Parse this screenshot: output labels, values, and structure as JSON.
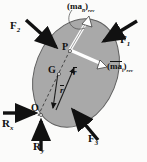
{
  "figure": {
    "background_color": "#fbfbfa",
    "body_fill": "#a9a9a9",
    "body_stroke": "#5a5a5a",
    "arrow_color": "#111111",
    "inertia_arrow_fill": "#ffffff"
  },
  "body": {
    "shape": "ellipse",
    "cx": 76,
    "cy": 73,
    "rx": 41,
    "ry": 56,
    "rotation_deg": 22
  },
  "points": [
    {
      "id": "P",
      "label": "P",
      "x": 70,
      "y": 50
    },
    {
      "id": "G",
      "label": "G",
      "x": 58,
      "y": 73
    },
    {
      "id": "O",
      "label": "O",
      "x": 40,
      "y": 113
    }
  ],
  "forces": [
    {
      "name": "F2",
      "label": "F",
      "subscript": "2",
      "label_x": 11,
      "label_y": 22,
      "tail": {
        "x": 27,
        "y": 21
      },
      "head": {
        "x": 58,
        "y": 49
      }
    },
    {
      "name": "F1",
      "label": "F",
      "subscript": "1",
      "label_x": 120,
      "label_y": 36,
      "tail": {
        "x": 136,
        "y": 22
      },
      "head": {
        "x": 101,
        "y": 42
      }
    },
    {
      "name": "F3",
      "label": "F",
      "subscript": "3",
      "label_x": 89,
      "label_y": 136,
      "tail": {
        "x": 97,
        "y": 139
      },
      "head": {
        "x": 71,
        "y": 107
      }
    },
    {
      "name": "Rx",
      "label": "R",
      "subscript": "x",
      "label_x": 3,
      "label_y": 122,
      "tail": {
        "x": 4,
        "y": 113
      },
      "head": {
        "x": 38,
        "y": 113
      }
    },
    {
      "name": "Ry",
      "label": "R",
      "subscript": "y",
      "label_x": 34,
      "label_y": 144,
      "tail": {
        "x": 41,
        "y": 150
      },
      "head": {
        "x": 41,
        "y": 118
      }
    }
  ],
  "inertia_vectors": [
    {
      "name": "man-rev",
      "open_paren": "(",
      "symbol": "ma",
      "symbol_sub": "n",
      "close_paren": ")",
      "rev": "rev",
      "label_x": 68,
      "label_y": 3,
      "tail": {
        "x": 70,
        "y": 50
      },
      "head": {
        "x": 89,
        "y": 18
      },
      "leader": {
        "from_x": 76,
        "from_y": 11,
        "to_x": 84,
        "to_y": 26
      }
    },
    {
      "name": "mat-rev",
      "open_paren": "(",
      "symbol": "ma",
      "symbol_overbar": true,
      "symbol_sub": "t",
      "close_paren": ")",
      "rev": "rev",
      "label_x": 108,
      "label_y": 63,
      "tail": {
        "x": 70,
        "y": 50
      },
      "head": {
        "x": 105,
        "y": 66
      }
    }
  ],
  "position_vectors": [
    {
      "name": "r-to-P",
      "label": "r",
      "overbar": true,
      "label_x": 75,
      "label_y": 73,
      "tail": {
        "x": 56,
        "y": 110
      },
      "head": {
        "x": 74,
        "y": 67
      }
    },
    {
      "name": "r-bar-to-G",
      "label": "r",
      "overbar": true,
      "label_x": 62,
      "label_y": 90,
      "tail": {
        "x": 58,
        "y": 73
      },
      "head": {
        "x": 52,
        "y": 112
      }
    }
  ],
  "dashed_axis": {
    "name": "O-G-P-axis",
    "from": {
      "x": 38,
      "y": 116
    },
    "to": {
      "x": 70,
      "y": 50
    }
  }
}
